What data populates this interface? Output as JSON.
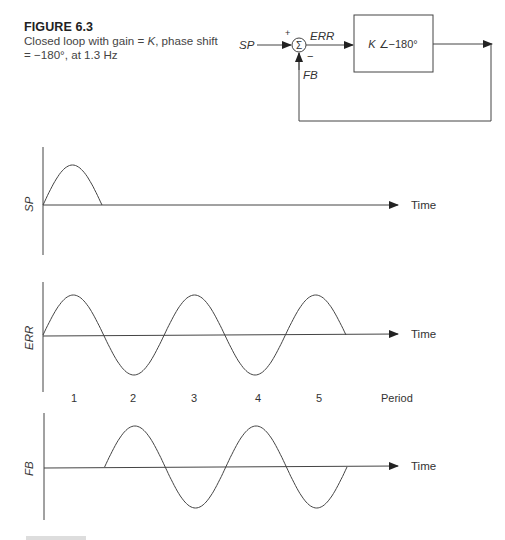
{
  "caption": {
    "figure_label": "FIGURE 6.3",
    "line1_prefix": "Closed loop with gain = ",
    "gain_symbol": "K",
    "line1_suffix": ", phase shift",
    "line2": "= −180°, at 1.3 Hz"
  },
  "block_diagram": {
    "input_label": "SP",
    "plus_sign": "+",
    "minus_sign": "−",
    "sum_symbol": "Σ",
    "error_label": "ERR",
    "feedback_label": "FB",
    "block_gain": "K",
    "block_angle": "∠−180°"
  },
  "graphs": {
    "sp": {
      "ylabel": "SP",
      "xlabel": "Time"
    },
    "err": {
      "ylabel": "ERR",
      "xlabel": "Time"
    },
    "fb": {
      "ylabel": "FB",
      "xlabel": "Time"
    },
    "period_axis": {
      "label": "Period",
      "ticks": [
        "1",
        "2",
        "3",
        "4",
        "5"
      ]
    }
  },
  "chart_data": [
    {
      "type": "line",
      "title": "SP",
      "xlabel": "Time",
      "ylabel": "SP",
      "description": "Single positive half-cycle pulse, then zero",
      "x_half_periods": [
        0,
        1,
        2,
        3,
        4,
        5
      ],
      "values": [
        0,
        1,
        0,
        0,
        0,
        0
      ],
      "grid": false
    },
    {
      "type": "line",
      "title": "ERR",
      "xlabel": "Time",
      "ylabel": "ERR",
      "description": "Sustained oscillation: 5 half-cycles alternating +,-,+,-,+",
      "period_labels": [
        "1",
        "2",
        "3",
        "4",
        "5"
      ],
      "half_cycle_signs": [
        1,
        -1,
        1,
        -1,
        1
      ],
      "grid": false
    },
    {
      "type": "line",
      "title": "FB",
      "xlabel": "Time",
      "ylabel": "FB",
      "description": "Delayed by one half-cycle: starts at period 2, 4 half-cycles +,-,+,-",
      "start_half_period": 1,
      "half_cycle_signs": [
        1,
        -1,
        1,
        -1
      ],
      "grid": false
    }
  ]
}
